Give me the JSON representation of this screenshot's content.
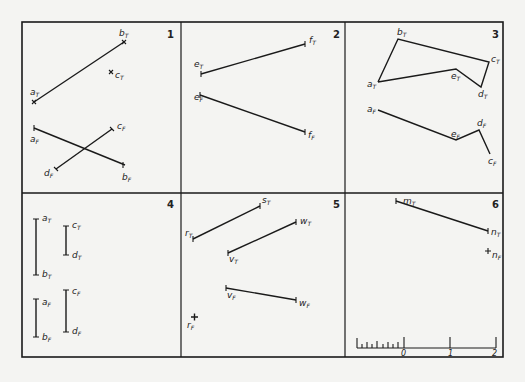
{
  "frame": {
    "left": 22,
    "top": 22,
    "right": 503,
    "bottom": 357,
    "col_dividers": [
      181,
      345
    ],
    "row_divider": 193
  },
  "panels": [
    {
      "number": "1",
      "labels": {
        "aT": "a",
        "bT": "b",
        "cT": "c",
        "aF": "a",
        "bF": "b",
        "cF": "c",
        "dF": "d"
      }
    },
    {
      "number": "2",
      "labels": {
        "eT": "e",
        "fT": "f",
        "eF": "e",
        "fF": "f"
      }
    },
    {
      "number": "3",
      "labels": {
        "aT": "a",
        "bT": "b",
        "cT": "c",
        "dT": "d",
        "eT": "e",
        "aF": "a",
        "eF": "e",
        "dF": "d",
        "cF": "c"
      }
    },
    {
      "number": "4",
      "labels": {
        "aT": "a",
        "bT": "b",
        "cT": "c",
        "dT": "d",
        "aF": "a",
        "bF": "b",
        "cF": "c",
        "dF": "d"
      }
    },
    {
      "number": "5",
      "labels": {
        "sT": "s",
        "rT": "r",
        "vT": "v",
        "wT": "w",
        "vF": "v",
        "wF": "w",
        "rF": "r"
      }
    },
    {
      "number": "6",
      "labels": {
        "mT": "m",
        "nT": "n",
        "nF": "n"
      }
    }
  ],
  "subscripts": {
    "top": "T",
    "front": "F"
  },
  "scale": {
    "ticks": [
      "0",
      "1",
      "2"
    ]
  }
}
